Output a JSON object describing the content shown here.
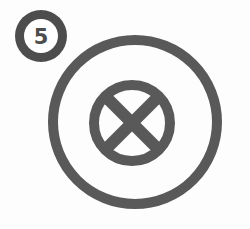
{
  "figure": {
    "badge": {
      "number": "5",
      "shape": "circle",
      "center_x": 41,
      "center_y": 36,
      "outer_radius": 26,
      "ring_width": 9,
      "color": "#4d4d4d",
      "fill": "#ffffff"
    },
    "outer_circle": {
      "center_x": 135,
      "center_y": 122,
      "radius": 82,
      "stroke_width": 10,
      "color": "#595959"
    },
    "inner_circle": {
      "center_x": 132,
      "center_y": 123,
      "radius": 38,
      "stroke_width": 10,
      "color": "#595959"
    },
    "cross": {
      "type": "diagonal-x",
      "center_x": 132,
      "center_y": 123,
      "arm_length": 38,
      "stroke_width": 12,
      "color": "#595959"
    },
    "colors": {
      "stroke": "#595959",
      "badge_stroke": "#4d4d4d",
      "background": "#fdfdfd",
      "white": "#ffffff"
    }
  }
}
